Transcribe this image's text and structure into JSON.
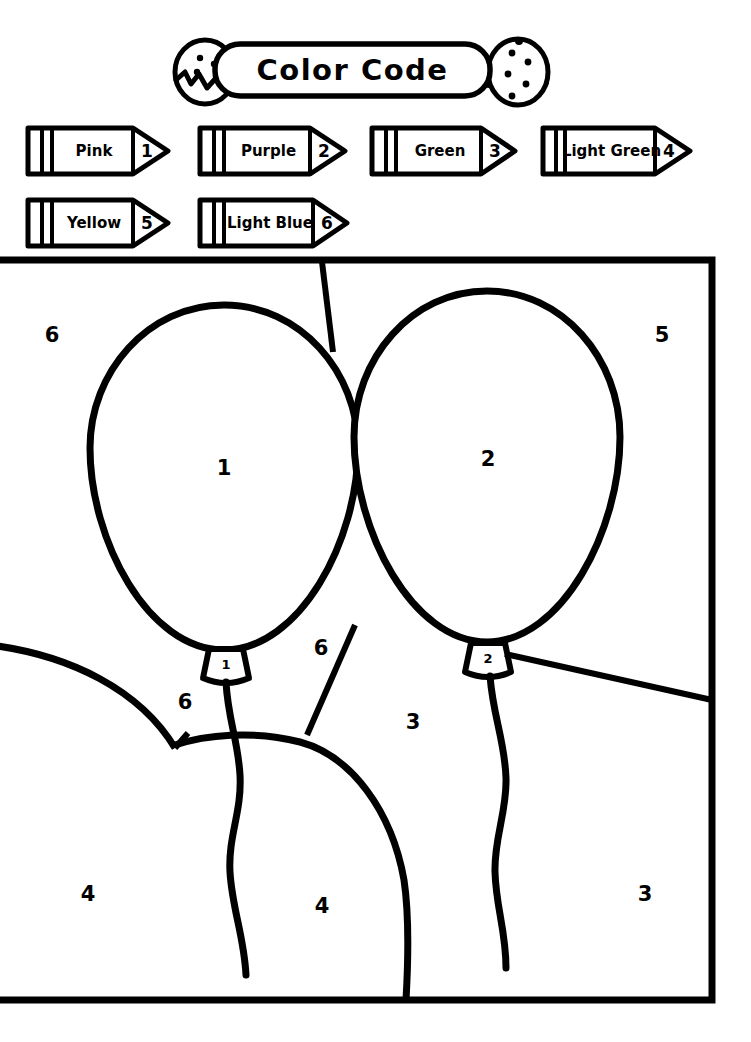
{
  "worksheet": {
    "title": "Color Code",
    "type": "color-by-number-balloons"
  },
  "header": {
    "banner_text": "Color Code",
    "left_decoration": "cracked-egg-icon",
    "right_decoration": "spotted-egg-icon"
  },
  "legend": {
    "items": [
      {
        "name": "Pink",
        "number": "1",
        "icon": "crayon-icon"
      },
      {
        "name": "Purple",
        "number": "2",
        "icon": "crayon-icon"
      },
      {
        "name": "Green",
        "number": "3",
        "icon": "crayon-icon"
      },
      {
        "name": "Light Green",
        "number": "4",
        "icon": "crayon-icon"
      },
      {
        "name": "Yellow",
        "number": "5",
        "icon": "crayon-icon"
      },
      {
        "name": "Light Blue",
        "number": "6",
        "icon": "crayon-icon"
      }
    ]
  },
  "picture": {
    "regions": [
      {
        "label": "6",
        "area": "background-top-left",
        "x": 52,
        "y": 335,
        "size": "big"
      },
      {
        "label": "1",
        "area": "left-balloon",
        "x": 224,
        "y": 468,
        "size": "big"
      },
      {
        "label": "2",
        "area": "right-balloon",
        "x": 488,
        "y": 459,
        "size": "big"
      },
      {
        "label": "5",
        "area": "background-top-right",
        "x": 662,
        "y": 335,
        "size": "big"
      },
      {
        "label": "1",
        "area": "left-balloon-knot",
        "x": 226,
        "y": 664,
        "size": "small"
      },
      {
        "label": "2",
        "area": "right-balloon-knot",
        "x": 488,
        "y": 658,
        "size": "small"
      },
      {
        "label": "6",
        "area": "background-middle",
        "x": 321,
        "y": 648,
        "size": "big"
      },
      {
        "label": "6",
        "area": "background-left-middle",
        "x": 185,
        "y": 702,
        "size": "big"
      },
      {
        "label": "3",
        "area": "background-center-right",
        "x": 413,
        "y": 722,
        "size": "big"
      },
      {
        "label": "4",
        "area": "hill-left",
        "x": 88,
        "y": 894,
        "size": "big"
      },
      {
        "label": "4",
        "area": "hill-center",
        "x": 322,
        "y": 906,
        "size": "big"
      },
      {
        "label": "3",
        "area": "background-bottom-right",
        "x": 645,
        "y": 894,
        "size": "big"
      }
    ]
  },
  "colors": {
    "ink": "#000000",
    "paper": "#ffffff"
  }
}
